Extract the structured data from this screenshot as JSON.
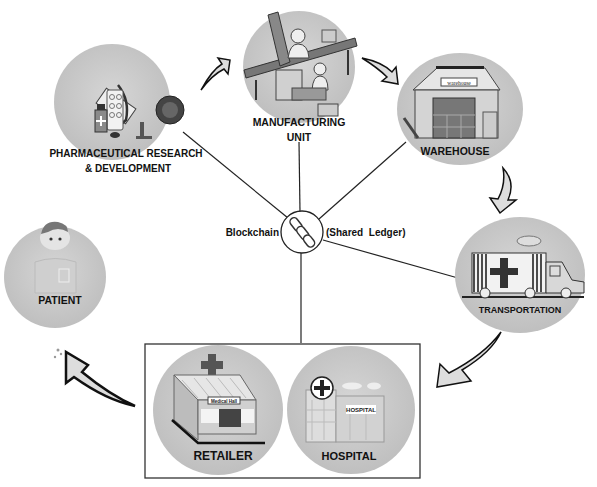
{
  "diagram": {
    "hub": {
      "label_left": "Blockchain",
      "label_right": "(Shared  Ledger)",
      "icon": "chain-link-icon"
    },
    "nodes": {
      "pharma": {
        "label_line1": "PHARMACEUTICAL RESEARCH",
        "label_line2": "&  DEVELOPMENT",
        "icon": "microscope-icon"
      },
      "manufacturing": {
        "label_line1": "MANUFACTURING",
        "label_line2": "UNIT",
        "icon": "factory-conveyor-icon"
      },
      "warehouse": {
        "label": "WAREHOUSE",
        "sign": "warehouse",
        "icon": "warehouse-icon"
      },
      "transportation": {
        "label": "TRANSPORTATION",
        "icon": "medical-truck-icon"
      },
      "retailer": {
        "label": "RETAILER",
        "sign": "Medical Hall",
        "icon": "pharmacy-store-icon"
      },
      "hospital": {
        "label": "HOSPITAL",
        "sign": "HOSPITAL",
        "icon": "hospital-building-icon"
      },
      "patient": {
        "label": "PATIENT",
        "icon": "patient-icon"
      }
    },
    "flow": [
      "pharma",
      "manufacturing",
      "warehouse",
      "transportation",
      "retailer/hospital",
      "patient"
    ],
    "colors": {
      "circle_fill": "#c9c9c9",
      "line": "#222222",
      "text": "#111111",
      "background": "#ffffff"
    }
  }
}
